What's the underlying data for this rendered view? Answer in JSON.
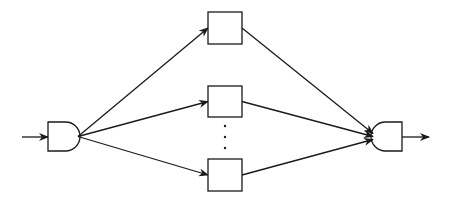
{
  "diagram": {
    "type": "parallel-branch-network",
    "stroke_color": "#1a1a1a",
    "background": "#ffffff",
    "input_arrow": {
      "x1": 22,
      "y1": 137,
      "x2": 48,
      "y2": 137
    },
    "output_arrow": {
      "x1": 402,
      "y1": 137,
      "x2": 429,
      "y2": 137
    },
    "split_gate": {
      "name": "split-node",
      "x": 48,
      "y": 122,
      "w": 32,
      "h": 29,
      "shape": "d-gate-right"
    },
    "merge_gate": {
      "name": "merge-node",
      "x": 371,
      "y": 122,
      "w": 31,
      "h": 29,
      "shape": "d-gate-left"
    },
    "branches": [
      {
        "name": "branch-1",
        "box": {
          "x": 208,
          "y": 12,
          "w": 34,
          "h": 32
        }
      },
      {
        "name": "branch-2",
        "box": {
          "x": 208,
          "y": 86,
          "w": 34,
          "h": 31
        }
      },
      {
        "name": "branch-n",
        "box": {
          "x": 208,
          "y": 159,
          "w": 34,
          "h": 32
        }
      }
    ],
    "ellipsis_dots": [
      {
        "cx": 225,
        "cy": 126
      },
      {
        "cx": 225,
        "cy": 137
      },
      {
        "cx": 225,
        "cy": 148
      }
    ]
  }
}
